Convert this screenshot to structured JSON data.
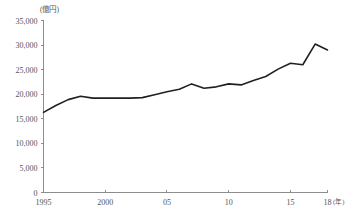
{
  "chart_data": {
    "type": "line",
    "title": "",
    "subtitle": "",
    "unit_label": "(億円)",
    "xlabel": "(年)",
    "ylabel": "",
    "xlim": [
      1995,
      2018
    ],
    "ylim": [
      0,
      35000
    ],
    "grid": false,
    "legend": false,
    "y_ticks": [
      0,
      5000,
      10000,
      15000,
      20000,
      25000,
      30000,
      35000
    ],
    "y_tick_labels": [
      "0",
      "5,000",
      "10,000",
      "15,000",
      "20,000",
      "25,000",
      "30,000",
      "35,000"
    ],
    "x_ticks": [
      1995,
      2000,
      2005,
      2010,
      2015,
      2018
    ],
    "x_tick_labels": [
      "1995",
      "2000",
      "05",
      "10",
      "15",
      "18"
    ],
    "series": [
      {
        "name": "値",
        "color": "#231f20",
        "x": [
          1995,
          1996,
          1997,
          1998,
          1999,
          2000,
          2001,
          2002,
          2003,
          2004,
          2005,
          2006,
          2007,
          2008,
          2009,
          2010,
          2011,
          2012,
          2013,
          2014,
          2015,
          2016,
          2017,
          2018
        ],
        "values": [
          16300,
          17700,
          18900,
          19600,
          19200,
          19200,
          19200,
          19200,
          19300,
          19900,
          20500,
          21000,
          22100,
          21200,
          21500,
          22100,
          21900,
          22800,
          23600,
          25100,
          26300,
          26000,
          30200,
          29000
        ]
      }
    ]
  }
}
